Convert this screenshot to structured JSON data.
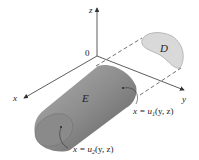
{
  "diagram": {
    "axes": {
      "x_label": "x",
      "y_label": "y",
      "z_label": "z",
      "origin_label": "0"
    },
    "region_label": "E",
    "projection_label": "D",
    "surfaces": {
      "back": {
        "lhs": "x = u",
        "sub": "1",
        "args": "(y, z)"
      },
      "front": {
        "lhs": "x = u",
        "sub": "2",
        "args": "(y, z)"
      }
    },
    "colors": {
      "solid_dark": "#6e6e6e",
      "solid_light": "#a8a8a8",
      "cap": "#8a8a8a",
      "projection_fill": "#d9d9d9",
      "line": "#333333"
    }
  }
}
